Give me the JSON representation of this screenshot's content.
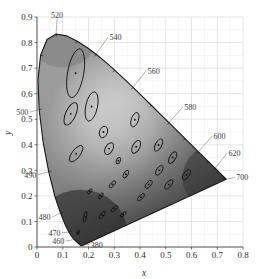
{
  "chart_data": {
    "type": "scatter",
    "title": "",
    "subtitle": "",
    "xlabel": "x",
    "ylabel": "y",
    "xlim": [
      0.0,
      0.8
    ],
    "ylim": [
      0.0,
      0.9
    ],
    "grid": true,
    "legend": "none",
    "xticks": [
      "0",
      "0.1",
      "0.2",
      "0.3",
      "0.4",
      "0.5",
      "0.6",
      "0.7",
      "0.8"
    ],
    "xtick_values": [
      0,
      0.1,
      0.2,
      0.3,
      0.4,
      0.5,
      0.6,
      0.7,
      0.8
    ],
    "yticks": [
      "0",
      "0.1",
      "0.2",
      "0.3",
      "0.4",
      "0.5",
      "0.6",
      "0.7",
      "0.8",
      "0.9"
    ],
    "ytick_values": [
      0,
      0.1,
      0.2,
      0.3,
      0.4,
      0.5,
      0.6,
      0.7,
      0.8,
      0.9
    ],
    "minor_grid_step": 0.05,
    "annotations": [
      {
        "label": "380",
        "x": 0.1741,
        "y": 0.005,
        "lx": 0.205,
        "ly": 0.012
      },
      {
        "label": "460",
        "x": 0.144,
        "y": 0.0297,
        "lx": 0.112,
        "ly": 0.023
      },
      {
        "label": "470",
        "x": 0.1241,
        "y": 0.0578,
        "lx": 0.097,
        "ly": 0.056
      },
      {
        "label": "480",
        "x": 0.0913,
        "y": 0.1327,
        "lx": 0.058,
        "ly": 0.117
      },
      {
        "label": "490",
        "x": 0.0454,
        "y": 0.295,
        "lx": 0.003,
        "ly": 0.283
      },
      {
        "label": "500",
        "x": 0.0082,
        "y": 0.5384,
        "lx": -0.028,
        "ly": 0.528
      },
      {
        "label": "520",
        "x": 0.0743,
        "y": 0.8338,
        "lx": 0.078,
        "ly": 0.893
      },
      {
        "label": "540",
        "x": 0.2296,
        "y": 0.7543,
        "lx": 0.276,
        "ly": 0.822
      },
      {
        "label": "560",
        "x": 0.3731,
        "y": 0.6245,
        "lx": 0.424,
        "ly": 0.69
      },
      {
        "label": "580",
        "x": 0.5125,
        "y": 0.4866,
        "lx": 0.566,
        "ly": 0.548
      },
      {
        "label": "600",
        "x": 0.627,
        "y": 0.3725,
        "lx": 0.68,
        "ly": 0.434
      },
      {
        "label": "620",
        "x": 0.6915,
        "y": 0.3083,
        "lx": 0.738,
        "ly": 0.367
      },
      {
        "label": "700",
        "x": 0.7347,
        "y": 0.2653,
        "lx": 0.768,
        "ly": 0.272
      }
    ],
    "locus_ticks": [
      380,
      460,
      470,
      480,
      490,
      500,
      510,
      520,
      530,
      540,
      550,
      560,
      570,
      580,
      590,
      600,
      610,
      620,
      700
    ],
    "spectral_locus": [
      [
        0.1741,
        0.005
      ],
      [
        0.174,
        0.005
      ],
      [
        0.1738,
        0.0049
      ],
      [
        0.1736,
        0.0049
      ],
      [
        0.1733,
        0.0048
      ],
      [
        0.173,
        0.0048
      ],
      [
        0.1726,
        0.0048
      ],
      [
        0.1721,
        0.0048
      ],
      [
        0.1714,
        0.0051
      ],
      [
        0.1703,
        0.0058
      ],
      [
        0.1689,
        0.0069
      ],
      [
        0.1669,
        0.0086
      ],
      [
        0.1644,
        0.0109
      ],
      [
        0.1611,
        0.0138
      ],
      [
        0.1566,
        0.0177
      ],
      [
        0.151,
        0.0227
      ],
      [
        0.144,
        0.0297
      ],
      [
        0.1355,
        0.0399
      ],
      [
        0.1241,
        0.0578
      ],
      [
        0.1096,
        0.0868
      ],
      [
        0.0913,
        0.1327
      ],
      [
        0.0687,
        0.2007
      ],
      [
        0.0454,
        0.295
      ],
      [
        0.0235,
        0.4127
      ],
      [
        0.0082,
        0.5384
      ],
      [
        0.0039,
        0.6548
      ],
      [
        0.0139,
        0.7502
      ],
      [
        0.0389,
        0.812
      ],
      [
        0.0743,
        0.8338
      ],
      [
        0.1142,
        0.8262
      ],
      [
        0.1547,
        0.8059
      ],
      [
        0.1929,
        0.7816
      ],
      [
        0.2296,
        0.7543
      ],
      [
        0.2658,
        0.7243
      ],
      [
        0.3016,
        0.6923
      ],
      [
        0.3373,
        0.6589
      ],
      [
        0.3731,
        0.6245
      ],
      [
        0.4087,
        0.5896
      ],
      [
        0.4441,
        0.5547
      ],
      [
        0.4788,
        0.5202
      ],
      [
        0.5125,
        0.4866
      ],
      [
        0.5448,
        0.4544
      ],
      [
        0.5752,
        0.4242
      ],
      [
        0.6029,
        0.3965
      ],
      [
        0.627,
        0.3725
      ],
      [
        0.6482,
        0.3514
      ],
      [
        0.6658,
        0.334
      ],
      [
        0.6801,
        0.3197
      ],
      [
        0.6915,
        0.3083
      ],
      [
        0.7006,
        0.2993
      ],
      [
        0.7079,
        0.292
      ],
      [
        0.714,
        0.2859
      ],
      [
        0.719,
        0.2809
      ],
      [
        0.723,
        0.277
      ],
      [
        0.726,
        0.274
      ],
      [
        0.7283,
        0.2717
      ],
      [
        0.73,
        0.27
      ],
      [
        0.7311,
        0.2689
      ],
      [
        0.732,
        0.268
      ],
      [
        0.7327,
        0.2673
      ],
      [
        0.7334,
        0.2666
      ],
      [
        0.734,
        0.266
      ],
      [
        0.7344,
        0.2656
      ],
      [
        0.7346,
        0.2654
      ],
      [
        0.7347,
        0.2653
      ]
    ],
    "ellipses": [
      {
        "cx": 0.16,
        "cy": 0.057,
        "a": 0.0085,
        "b": 0.0035,
        "angle": 62
      },
      {
        "cx": 0.187,
        "cy": 0.118,
        "a": 0.022,
        "b": 0.0055,
        "angle": 77
      },
      {
        "cx": 0.253,
        "cy": 0.125,
        "a": 0.018,
        "b": 0.0062,
        "angle": 55
      },
      {
        "cx": 0.15,
        "cy": 0.68,
        "a": 0.096,
        "b": 0.0315,
        "angle": 80
      },
      {
        "cx": 0.131,
        "cy": 0.521,
        "a": 0.047,
        "b": 0.02,
        "angle": 66
      },
      {
        "cx": 0.212,
        "cy": 0.55,
        "a": 0.058,
        "b": 0.023,
        "angle": 78
      },
      {
        "cx": 0.258,
        "cy": 0.45,
        "a": 0.023,
        "b": 0.0153,
        "angle": 70
      },
      {
        "cx": 0.152,
        "cy": 0.365,
        "a": 0.038,
        "b": 0.016,
        "angle": 53
      },
      {
        "cx": 0.28,
        "cy": 0.385,
        "a": 0.025,
        "b": 0.0145,
        "angle": 60
      },
      {
        "cx": 0.38,
        "cy": 0.498,
        "a": 0.029,
        "b": 0.014,
        "angle": 71
      },
      {
        "cx": 0.385,
        "cy": 0.392,
        "a": 0.027,
        "b": 0.014,
        "angle": 63
      },
      {
        "cx": 0.472,
        "cy": 0.399,
        "a": 0.026,
        "b": 0.0123,
        "angle": 61
      },
      {
        "cx": 0.527,
        "cy": 0.35,
        "a": 0.025,
        "b": 0.0115,
        "angle": 59
      },
      {
        "cx": 0.475,
        "cy": 0.3,
        "a": 0.021,
        "b": 0.0107,
        "angle": 57
      },
      {
        "cx": 0.58,
        "cy": 0.283,
        "a": 0.023,
        "b": 0.011,
        "angle": 56
      },
      {
        "cx": 0.512,
        "cy": 0.245,
        "a": 0.022,
        "b": 0.01,
        "angle": 50
      },
      {
        "cx": 0.434,
        "cy": 0.245,
        "a": 0.0183,
        "b": 0.009,
        "angle": 52
      },
      {
        "cx": 0.404,
        "cy": 0.195,
        "a": 0.018,
        "b": 0.0075,
        "angle": 46
      },
      {
        "cx": 0.345,
        "cy": 0.285,
        "a": 0.016,
        "b": 0.008,
        "angle": 58
      },
      {
        "cx": 0.316,
        "cy": 0.338,
        "a": 0.013,
        "b": 0.0075,
        "angle": 64
      },
      {
        "cx": 0.293,
        "cy": 0.245,
        "a": 0.0165,
        "b": 0.0072,
        "angle": 49
      },
      {
        "cx": 0.248,
        "cy": 0.2,
        "a": 0.0135,
        "b": 0.006,
        "angle": 55
      },
      {
        "cx": 0.205,
        "cy": 0.218,
        "a": 0.012,
        "b": 0.0055,
        "angle": 47
      },
      {
        "cx": 0.301,
        "cy": 0.15,
        "a": 0.0165,
        "b": 0.0068,
        "angle": 43
      },
      {
        "cx": 0.335,
        "cy": 0.128,
        "a": 0.014,
        "b": 0.0057,
        "angle": 41
      }
    ],
    "ellipse_scale_note": "ellipses drawn at 10x standard deviation",
    "white_point": {
      "x": 0.3127,
      "y": 0.329
    }
  },
  "style": {
    "background": "#ffffff",
    "grid_color": "#d9d9d9",
    "axis_color": "#4a4a4a",
    "locus_color": "#1a1a1a",
    "ellipse_color": "#161616",
    "text_color": "#2b2b2b"
  }
}
